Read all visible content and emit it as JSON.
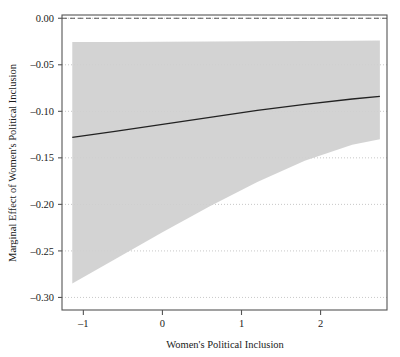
{
  "chart_data": {
    "type": "line",
    "title": "",
    "subtitle": "",
    "xlabel": "Women's Political Inclusion",
    "ylabel": "Marginal Effect of Women's Political Inclusion",
    "xlim": [
      -1.27,
      2.84
    ],
    "ylim": [
      -0.3135,
      0.0035
    ],
    "xticks": [
      -1,
      0,
      1,
      2
    ],
    "xticklabels": [
      "-1",
      "0",
      "1",
      "2"
    ],
    "yticks": [
      0.0,
      -0.05,
      -0.1,
      -0.15,
      -0.2,
      -0.25,
      -0.3
    ],
    "yticklabels": [
      "0.00",
      "-0.05",
      "-0.10",
      "-0.15",
      "-0.20",
      "-0.25",
      "-0.30"
    ],
    "grid": true,
    "grid_axis": "y",
    "grid_style": "dotted",
    "legend": null,
    "legend_position": "none",
    "reference_line": {
      "name": "zero-line",
      "y": 0.0,
      "style": "dashed",
      "color": "#444444"
    },
    "series": [
      {
        "name": "Marginal effect estimate",
        "type": "line",
        "color": "#222222",
        "x": [
          -1.14,
          -0.6,
          0.0,
          0.6,
          1.2,
          1.8,
          2.4,
          2.75
        ],
        "values": [
          -0.128,
          -0.1215,
          -0.114,
          -0.1065,
          -0.099,
          -0.0925,
          -0.0868,
          -0.084
        ]
      },
      {
        "name": "95% confidence interval",
        "type": "band",
        "color": "#cfcfcf",
        "x": [
          -1.14,
          -0.6,
          0.0,
          0.6,
          1.2,
          1.8,
          2.4,
          2.75
        ],
        "upper": [
          -0.0255,
          -0.0255,
          -0.0252,
          -0.025,
          -0.0247,
          -0.0245,
          -0.0242,
          -0.024
        ],
        "lower": [
          -0.285,
          -0.259,
          -0.23,
          -0.202,
          -0.176,
          -0.153,
          -0.136,
          -0.13
        ]
      }
    ]
  },
  "axes": {
    "x_title": "Women's Political Inclusion",
    "y_title": "Marginal Effect of Women's Political Inclusion"
  }
}
